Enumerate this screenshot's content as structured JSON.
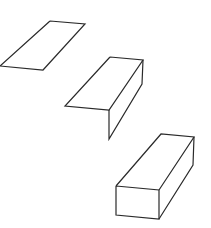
{
  "diagram": {
    "stroke_color": "#2a2a2a",
    "background": "#ffffff",
    "shapes": [
      {
        "name": "flat-strip",
        "polylines": [
          "50,21 85,24 43,70 0,66 50,21"
        ]
      },
      {
        "name": "folded-strip",
        "polylines": [
          "110,57 143,60 109,110 65,106 110,57",
          "143,60 142,84 109,139 109,110"
        ]
      },
      {
        "name": "rectangular-prism",
        "polylines": [
          "116,186 159,190 159,219 116,215 116,186",
          "116,186 161,134 194,137 159,190",
          "194,137 193,165 159,219"
        ]
      }
    ]
  }
}
